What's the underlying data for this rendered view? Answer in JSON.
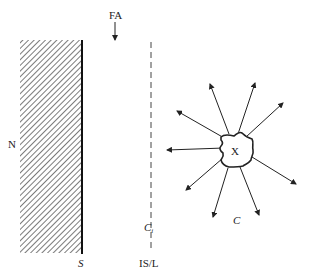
{
  "diagram": {
    "labels": {
      "fa": "FA",
      "n": "N",
      "s": "S",
      "ci_main": "C",
      "ci_sub": "i",
      "isl": "IS/L",
      "x": "X",
      "c": "C"
    },
    "elements": {
      "surface": "hatched-surface",
      "interface_line": "dashed-line",
      "particle": "irregular-blob",
      "arrows": 9
    },
    "colors": {
      "ink": "#222222",
      "background": "#ffffff"
    }
  }
}
